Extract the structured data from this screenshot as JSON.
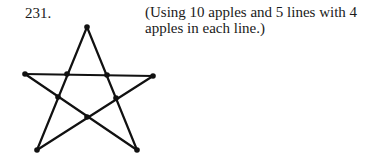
{
  "problem": {
    "number": "231.",
    "caption": "(Using 10 apples and 5 lines with 4 apples in each line.)"
  },
  "figure": {
    "dot_count": 10,
    "line_count": 5,
    "dots_per_line": 4
  }
}
